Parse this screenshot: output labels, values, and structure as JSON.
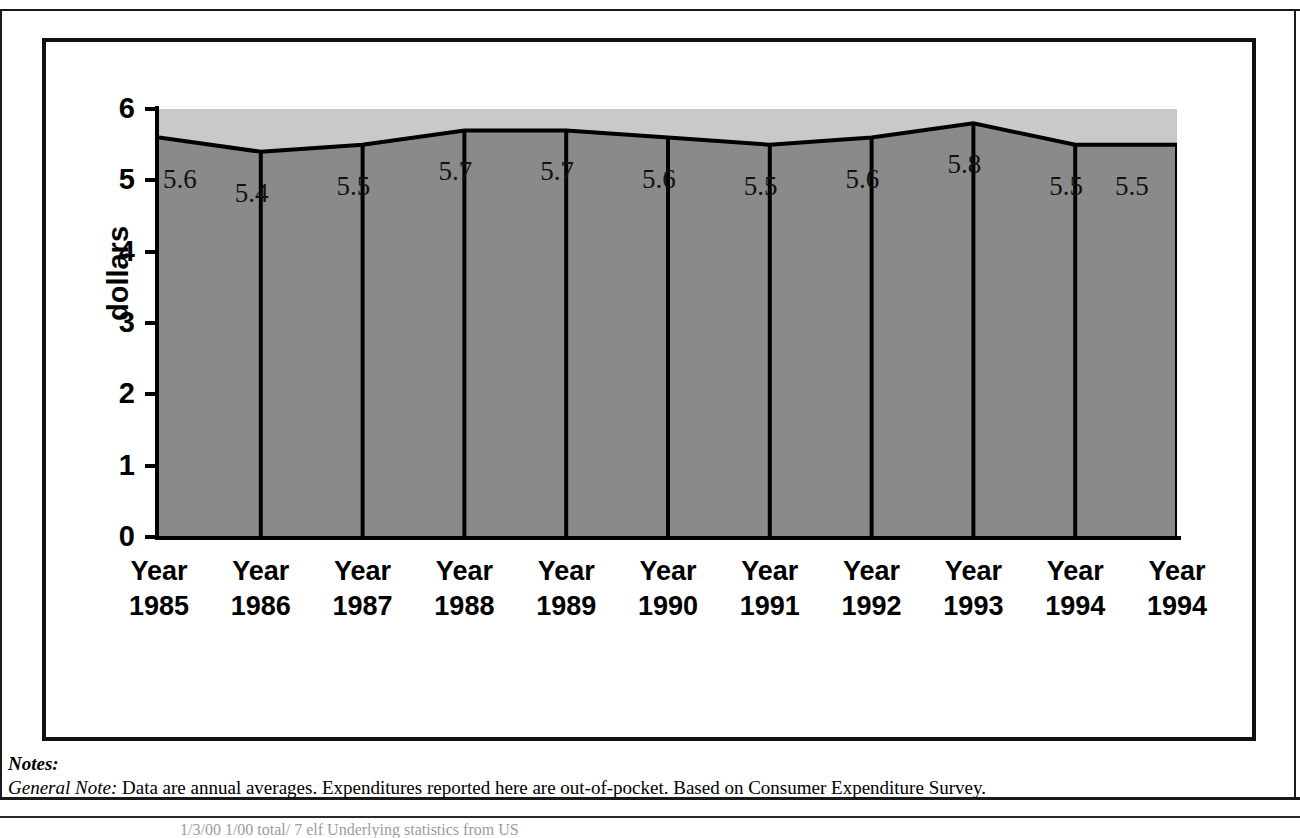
{
  "figure": {
    "y_axis_title": "dollars"
  },
  "chart_data": {
    "type": "area",
    "title": "",
    "xlabel": "",
    "ylabel": "dollars",
    "ylim": [
      0,
      6
    ],
    "yticks": [
      "0",
      "1",
      "2",
      "3",
      "4",
      "5",
      "6"
    ],
    "grid": false,
    "legend": "none",
    "categories": [
      "Year 1985",
      "Year 1986",
      "Year 1987",
      "Year 1988",
      "Year 1989",
      "Year 1990",
      "Year 1991",
      "Year 1992",
      "Year 1993",
      "Year 1994",
      "Year 1994"
    ],
    "category_lines": [
      {
        "top": "Year",
        "bottom": "1985"
      },
      {
        "top": "Year",
        "bottom": "1986"
      },
      {
        "top": "Year",
        "bottom": "1987"
      },
      {
        "top": "Year",
        "bottom": "1988"
      },
      {
        "top": "Year",
        "bottom": "1989"
      },
      {
        "top": "Year",
        "bottom": "1990"
      },
      {
        "top": "Year",
        "bottom": "1991"
      },
      {
        "top": "Year",
        "bottom": "1992"
      },
      {
        "top": "Year",
        "bottom": "1993"
      },
      {
        "top": "Year",
        "bottom": "1994"
      },
      {
        "top": "Year",
        "bottom": "1994"
      }
    ],
    "values": [
      5.6,
      5.4,
      5.5,
      5.7,
      5.7,
      5.6,
      5.5,
      5.6,
      5.8,
      5.5,
      5.5
    ],
    "data_labels": [
      "5.6",
      "5.4",
      "5.5",
      "5.7",
      "5.7",
      "5.6",
      "5.5",
      "5.6",
      "5.8",
      "5.5",
      "5.5"
    ],
    "colors": {
      "area_fill": "#8a8a8a",
      "plot_background": "#c9c9c9",
      "line": "#000000",
      "drop_lines": "#000000"
    }
  },
  "notes": {
    "heading": "Notes:",
    "general_note_label": "General Note:",
    "general_note_text": " Data are annual averages. Expenditures reported here are out-of-pocket. Based on Consumer Expenditure Survey.",
    "source_line": "1/3/00   1/00  total/    7 elf   Underlying statistics from US"
  }
}
